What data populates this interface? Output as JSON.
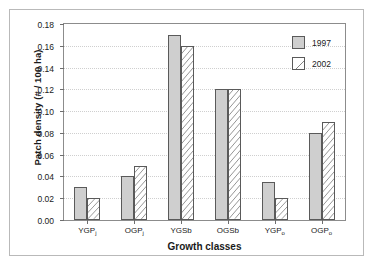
{
  "chart_data": {
    "type": "bar",
    "title": "",
    "xlabel": "Growth classes",
    "ylabel": "Patch density (# / 100 ha)",
    "categories": [
      "YGPj",
      "OGPj",
      "YGSb",
      "OGSb",
      "YGPo",
      "OGPo"
    ],
    "category_bases": [
      "YGP",
      "OGP",
      "YGSb",
      "OGSb",
      "YGP",
      "OGP"
    ],
    "category_subs": [
      "j",
      "j",
      "",
      "",
      "o",
      "o"
    ],
    "series": [
      {
        "name": "1997",
        "values": [
          0.03,
          0.04,
          0.17,
          0.12,
          0.035,
          0.08
        ],
        "color": "#cfcfcf",
        "pattern": "solid"
      },
      {
        "name": "2002",
        "values": [
          0.02,
          0.05,
          0.16,
          0.12,
          0.02,
          0.09
        ],
        "color": "#ffffff",
        "pattern": "diagonal-hatch"
      }
    ],
    "ylim": [
      0.0,
      0.18
    ],
    "ytick_values": [
      0.0,
      0.02,
      0.04,
      0.06,
      0.08,
      0.1,
      0.12,
      0.14,
      0.16,
      0.18
    ],
    "ytick_labels": [
      "0.00",
      "0.02",
      "0.04",
      "0.06",
      "0.08",
      "0.10",
      "0.12",
      "0.14",
      "0.16",
      "0.18"
    ],
    "grid": true,
    "grid_style": "dotted",
    "legend_position": "top-right",
    "legend_entries": [
      "1997",
      "2002"
    ]
  },
  "legend": {
    "entries": [
      {
        "label": "1997"
      },
      {
        "label": "2002"
      }
    ]
  },
  "axes": {
    "x_title": "Growth classes",
    "y_title": "Patch density (# / 100 ha)"
  },
  "colors": {
    "series_1997": "#cfcfcf",
    "series_2002": "#ffffff",
    "bar_outline": "#5a5a5a",
    "axis": "#8c8c8c",
    "grid": "#cfcfcf",
    "frame": "#b9b9b9",
    "text": "#1a1a1a"
  }
}
